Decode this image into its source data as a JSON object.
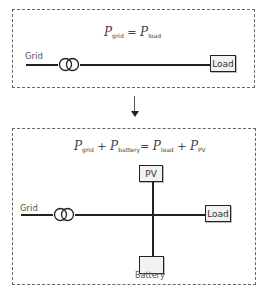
{
  "top_panel": {
    "equation": {
      "lhs": [
        {
          "symbol": "P",
          "subscript": "grid"
        }
      ],
      "operator": "=",
      "rhs": [
        {
          "symbol": "P",
          "subscript": "load"
        }
      ]
    },
    "nodes": {
      "grid_label": "Grid",
      "load_label": "Load",
      "transformer_icon": "transformer-icon"
    }
  },
  "arrow": {
    "direction": "down"
  },
  "bottom_panel": {
    "equation": {
      "lhs": [
        {
          "symbol": "P",
          "subscript": "grid"
        },
        {
          "op": "+"
        },
        {
          "symbol": "P",
          "subscript": "battery"
        }
      ],
      "operator": "=",
      "rhs": [
        {
          "symbol": "P",
          "subscript": "load"
        },
        {
          "op": "+"
        },
        {
          "symbol": "P",
          "subscript": "PV"
        }
      ]
    },
    "nodes": {
      "grid_label": "Grid",
      "load_label": "Load",
      "pv_label": "PV",
      "battery_label": "Battery",
      "transformer_icon": "transformer-icon"
    }
  },
  "colors": {
    "line": "#222222",
    "box_fill": "#f2f2f2",
    "dash_border": "#666666"
  }
}
